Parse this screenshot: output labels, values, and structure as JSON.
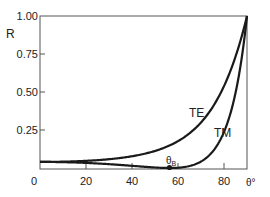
{
  "chart_data": {
    "type": "line",
    "title": "",
    "xlabel": "θ°",
    "ylabel": "R",
    "xlim": [
      0,
      90
    ],
    "ylim": [
      0,
      1.0
    ],
    "x_ticks": [
      0,
      20,
      40,
      60,
      80
    ],
    "x_tick_labels": [
      "0",
      "20",
      "40",
      "60",
      "80"
    ],
    "y_ticks": [
      0.25,
      0.5,
      0.75,
      1.0
    ],
    "y_tick_labels": [
      "0.25",
      "0.50",
      "0.75",
      "1.00"
    ],
    "grid": false,
    "legend": "inline labels",
    "x": [
      0,
      10,
      20,
      30,
      40,
      50,
      56.3,
      60,
      70,
      80,
      85,
      90
    ],
    "series": [
      {
        "name": "TE",
        "values": [
          0.04,
          0.041,
          0.045,
          0.058,
          0.085,
          0.135,
          0.18,
          0.229,
          0.4,
          0.653,
          0.81,
          1.0
        ]
      },
      {
        "name": "TM",
        "values": [
          0.04,
          0.039,
          0.034,
          0.025,
          0.01,
          0.0017,
          0.0,
          0.0017,
          0.041,
          0.247,
          0.5,
          1.0
        ]
      }
    ],
    "annotations": [
      {
        "text": "θB",
        "x": 56.3,
        "y": 0.0,
        "note": "Brewster angle marker on TM curve"
      },
      {
        "text": "TE",
        "x": 69,
        "y": 0.36
      },
      {
        "text": "TM",
        "x": 78,
        "y": 0.27
      }
    ]
  },
  "labels": {
    "y_axis": "R",
    "x_axis": "θ°",
    "te": "TE",
    "tm": "TM",
    "brewster_main": "θ",
    "brewster_sub": "B"
  }
}
